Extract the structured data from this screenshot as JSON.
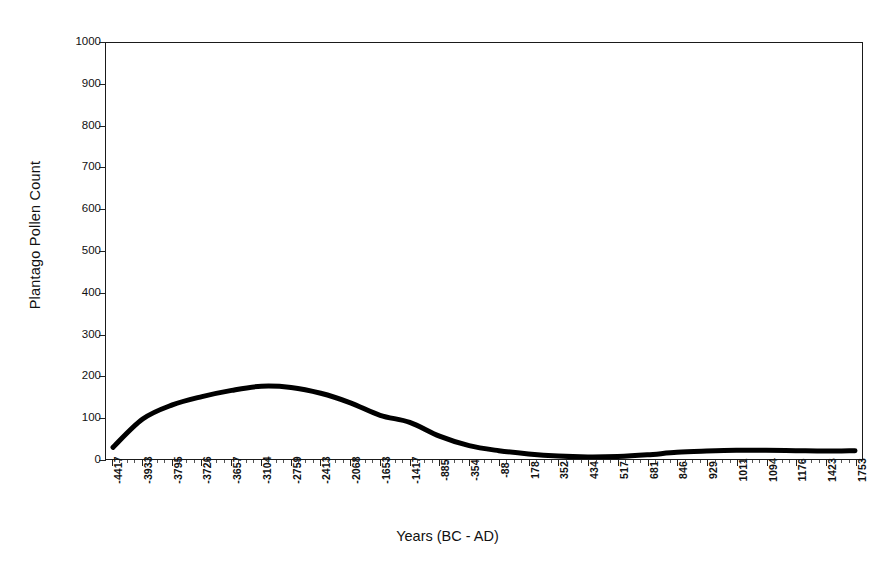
{
  "chart_data": {
    "type": "line",
    "title": "",
    "xlabel": "Years (BC - AD)",
    "ylabel": "Plantago Pollen Count",
    "ylim": [
      0,
      1000
    ],
    "y_ticks": [
      0,
      100,
      200,
      300,
      400,
      500,
      600,
      700,
      800,
      900,
      1000
    ],
    "grid": false,
    "legend": null,
    "categories": [
      "-4417",
      "-3933",
      "-3795",
      "-3726",
      "-3657",
      "-3104",
      "-2759",
      "-2413",
      "-2068",
      "-1653",
      "-1417",
      "-885",
      "-354",
      "-88",
      "178",
      "352",
      "434",
      "517",
      "681",
      "846",
      "929",
      "1011",
      "1094",
      "1176",
      "1423",
      "1753"
    ],
    "values": [
      28,
      96,
      130,
      150,
      165,
      175,
      172,
      158,
      135,
      105,
      88,
      55,
      32,
      20,
      12,
      7,
      5,
      6,
      10,
      16,
      19,
      21,
      21,
      20,
      19,
      20
    ],
    "series": [
      {
        "name": "Plantago Pollen Count",
        "color": "#000000",
        "values": [
          28,
          96,
          130,
          150,
          165,
          175,
          172,
          158,
          135,
          105,
          88,
          55,
          32,
          20,
          12,
          7,
          5,
          6,
          10,
          16,
          19,
          21,
          21,
          20,
          19,
          20
        ]
      }
    ],
    "notes": {
      "peak_value": 175,
      "peak_category": "-3104",
      "minimum_value": 5,
      "minimum_category": "434",
      "start_value": 28,
      "end_value": 20,
      "line_color": "#000000",
      "axis_color": "#1a1a1a",
      "background": "#ffffff"
    }
  },
  "axes": {
    "y_title": "Plantago Pollen Count",
    "x_title": "Years (BC - AD)"
  }
}
